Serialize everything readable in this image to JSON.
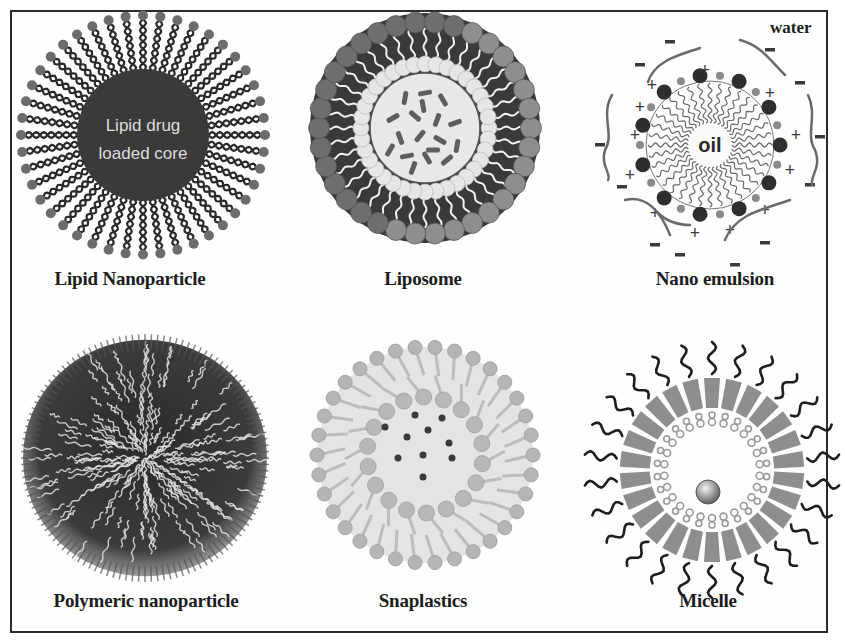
{
  "figure": {
    "water_label": "water",
    "panels": [
      {
        "id": "lipid-nanoparticle",
        "label": "Lipid Nanoparticle",
        "inner_text": [
          "Lipid drug",
          "loaded core"
        ]
      },
      {
        "id": "liposome",
        "label": "Liposome"
      },
      {
        "id": "nano-emulsion",
        "label": "Nano emulsion",
        "inner_text": [
          "oil"
        ],
        "charges": {
          "positive": "+",
          "negative": "-"
        }
      },
      {
        "id": "polymeric-nanoparticle",
        "label": "Polymeric nanoparticle"
      },
      {
        "id": "snaplastics",
        "label": "Snaplastics"
      },
      {
        "id": "micelle",
        "label": "Micelle"
      }
    ]
  },
  "colors": {
    "border": "#2b2b2b",
    "text": "#1c1c1c",
    "dark_core": "#3a3a3a",
    "mid_gray": "#8a8a8a",
    "light_gray": "#c8c8c8",
    "pale_gray": "#e4e4e4"
  }
}
